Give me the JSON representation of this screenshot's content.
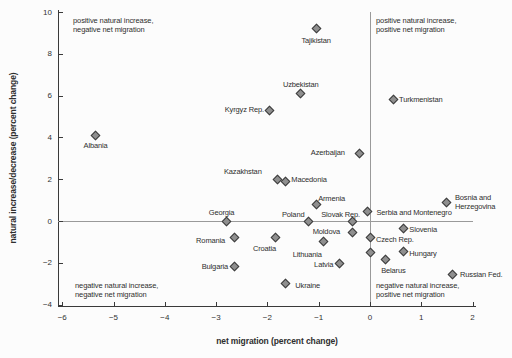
{
  "chart_data": {
    "type": "scatter",
    "xlabel": "net migration (percent change)",
    "ylabel": "natural increase/decrease (percent change)",
    "xlim": [
      -6,
      2
    ],
    "ylim": [
      -4,
      10
    ],
    "grid": false,
    "reference_lines": {
      "vertical_at_x": 0,
      "horizontal_at_y": 0
    },
    "x_ticks": [
      {
        "v": -6,
        "label": "−6"
      },
      {
        "v": -5,
        "label": "−5"
      },
      {
        "v": -4,
        "label": "−4"
      },
      {
        "v": -3,
        "label": "−3"
      },
      {
        "v": -2,
        "label": "−2"
      },
      {
        "v": -1,
        "label": "−1"
      },
      {
        "v": 0,
        "label": "0"
      },
      {
        "v": 1,
        "label": "1"
      },
      {
        "v": 2,
        "label": "2"
      }
    ],
    "y_ticks": [
      {
        "v": 10,
        "label": "10"
      },
      {
        "v": 8,
        "label": "8"
      },
      {
        "v": 6,
        "label": "6"
      },
      {
        "v": 4,
        "label": "4"
      },
      {
        "v": 2,
        "label": "2"
      },
      {
        "v": 0,
        "label": "0"
      },
      {
        "v": -2,
        "label": "−2"
      },
      {
        "v": -4,
        "label": "−4"
      }
    ],
    "annotations": [
      {
        "id": "top-left",
        "lines": [
          "positive natural increase,",
          "negative net migration"
        ]
      },
      {
        "id": "top-right",
        "lines": [
          "positive natural increase,",
          "positive net migration"
        ]
      },
      {
        "id": "bottom-left",
        "lines": [
          "negative natural increase,",
          "negative net migration"
        ]
      },
      {
        "id": "bottom-right",
        "lines": [
          "negative natural increase,",
          "positive net migration"
        ]
      }
    ],
    "points": [
      {
        "label": "Tajikistan",
        "x": -1.05,
        "y": 9.2,
        "pos": "below",
        "dy": 1
      },
      {
        "label": "Uzbekistan",
        "x": -1.35,
        "y": 6.1,
        "pos": "above"
      },
      {
        "label": "Turkmenistan",
        "x": 0.45,
        "y": 5.8,
        "pos": "right"
      },
      {
        "label": "Kyrgyz Rep.",
        "x": -1.95,
        "y": 5.3,
        "pos": "left"
      },
      {
        "label": "Albania",
        "x": -5.35,
        "y": 4.1,
        "pos": "below"
      },
      {
        "label": "Azerbaijan",
        "x": -0.2,
        "y": 3.25,
        "pos": "left",
        "dx": -9
      },
      {
        "label": "Kazakhstan",
        "x": -1.8,
        "y": 2.0,
        "pos": "left",
        "dx": -10,
        "dy": -7
      },
      {
        "label": "Macedonia",
        "x": -1.65,
        "y": 1.9,
        "pos": "right",
        "dy": -1
      },
      {
        "label": "Armenia",
        "x": -1.05,
        "y": 0.8,
        "pos": "above-right",
        "dy": 2
      },
      {
        "label": "Bosnia and Herzegovina",
        "lines": [
          "Bosnia and",
          "Herzegovina"
        ],
        "x": 1.5,
        "y": 0.9,
        "pos": "right",
        "dx": 2
      },
      {
        "label": "Serbia and Montenegro",
        "x": -0.05,
        "y": 0.45,
        "pos": "right",
        "dx": 3,
        "dy": 1
      },
      {
        "label": "Georgia",
        "x": -2.8,
        "y": 0.0,
        "pos": "above-left"
      },
      {
        "label": "Poland",
        "x": -1.2,
        "y": 0.0,
        "pos": "left",
        "dx": 2,
        "dy": -6
      },
      {
        "label": "Slovak Rep.",
        "x": -0.35,
        "y": 0.0,
        "pos": "above-left",
        "dy": 2
      },
      {
        "label": "Slovenia",
        "x": 0.65,
        "y": -0.35,
        "pos": "right",
        "dy": 2
      },
      {
        "label": "Moldova",
        "x": -0.35,
        "y": -0.55,
        "pos": "left",
        "dx": -6
      },
      {
        "label": "Romania",
        "x": -2.65,
        "y": -0.8,
        "pos": "left",
        "dx": -3,
        "dy": 3
      },
      {
        "label": "Croatia",
        "x": -1.85,
        "y": -0.8,
        "pos": "below-left"
      },
      {
        "label": "Czech Rep.",
        "x": 0.0,
        "y": -0.8,
        "pos": "right",
        "dy": 2
      },
      {
        "label": "Lithuania",
        "x": -0.9,
        "y": -1.0,
        "pos": "below-left",
        "dx": -3,
        "dy": 2
      },
      {
        "label": "Hungary",
        "x": 0.65,
        "y": -1.45,
        "pos": "right",
        "dy": 3
      },
      {
        "label": "",
        "x": 0.0,
        "y": -1.5,
        "pos": "none"
      },
      {
        "label": "Belarus",
        "x": 0.3,
        "y": -1.85,
        "pos": "below",
        "dx": 8
      },
      {
        "label": "Latvia",
        "x": -0.6,
        "y": -2.05,
        "pos": "left",
        "dy": 1
      },
      {
        "label": "Bulgaria",
        "x": -2.65,
        "y": -2.2,
        "pos": "left"
      },
      {
        "label": "Russian Fed.",
        "x": 1.6,
        "y": -2.55,
        "pos": "right",
        "dx": 2,
        "dy": 1
      },
      {
        "label": "Ukraine",
        "x": -1.65,
        "y": -3.0,
        "pos": "right",
        "dx": 4,
        "dy": 2
      }
    ]
  },
  "colors": {
    "background": "#fcfcfc",
    "marker_fill": "#8f8f8f",
    "marker_stroke": "#3d3d3d",
    "axis_line": "#3a3a3a",
    "reference_line": "#9a9a9a",
    "text": "#2e2e2e"
  }
}
